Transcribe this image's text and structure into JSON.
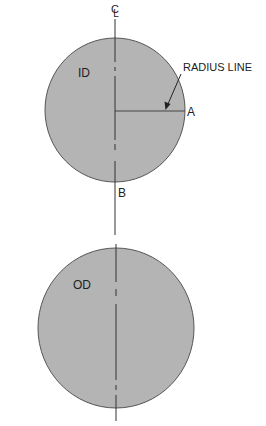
{
  "diagram": {
    "colors": {
      "background": "#ffffff",
      "circle_fill": "#b4b4b4",
      "circle_stroke": "#555555",
      "line": "#333333",
      "text": "#222222"
    },
    "centerline_symbol": "CL",
    "top_circle": {
      "label": "ID",
      "cx": 115,
      "cy": 110,
      "rx": 70,
      "ry": 72
    },
    "bottom_circle": {
      "label": "OD",
      "cx": 116,
      "cy": 328,
      "rx": 78,
      "ry": 80
    },
    "radius_line": {
      "label": "RADIUS LINE",
      "point_a_label": "A",
      "point_b_label": "B"
    }
  }
}
